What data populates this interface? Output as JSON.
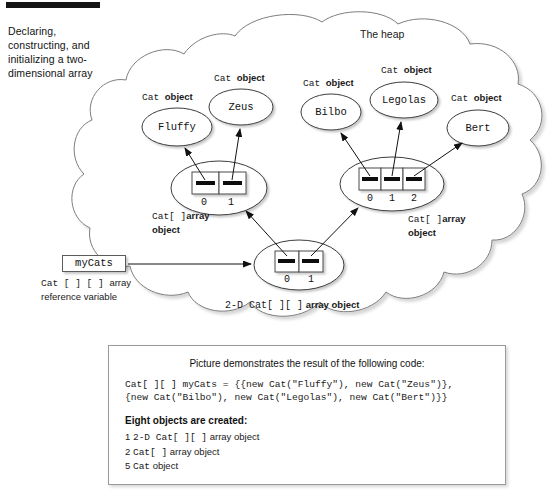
{
  "figure": {
    "side_caption": "Declaring, constructing, and initializing a two-dimensional array",
    "heap_label": "The heap"
  },
  "cat_objects": [
    {
      "name": "Fluffy",
      "caption_mono": "Cat ",
      "caption_bold": "object",
      "cx": 177,
      "cy": 127,
      "rx": 35,
      "ry": 19,
      "cap_x": 140,
      "cap_y": 95
    },
    {
      "name": "Zeus",
      "caption_mono": "Cat ",
      "caption_bold": "object",
      "cx": 241,
      "cy": 107,
      "rx": 32,
      "ry": 18,
      "cap_x": 213,
      "cap_y": 76
    },
    {
      "name": "Bilbo",
      "caption_mono": "Cat ",
      "caption_bold": "object",
      "cx": 331,
      "cy": 112,
      "rx": 30,
      "ry": 18,
      "cap_x": 302,
      "cap_y": 81
    },
    {
      "name": "Legolas",
      "caption_mono": "Cat ",
      "caption_bold": "object",
      "cx": 404,
      "cy": 100,
      "rx": 34,
      "ry": 18,
      "cap_x": 380,
      "cap_y": 69
    },
    {
      "name": "Bert",
      "caption_mono": "Cat ",
      "caption_bold": "object",
      "cx": 478,
      "cy": 128,
      "rx": 31,
      "ry": 18,
      "cap_x": 450,
      "cap_y": 96
    }
  ],
  "arrays": {
    "left": {
      "indices": [
        "0",
        "1"
      ],
      "label_line1_mono": "Cat[ ]",
      "label_line1_bold": "array",
      "label_line2_bold": "object",
      "label_x": 152,
      "label_y": 210
    },
    "right": {
      "indices": [
        "0",
        "1",
        "2"
      ],
      "label_line1_mono": "Cat[ ]",
      "label_line1_bold": "array",
      "label_line2_bold": "object",
      "label_x": 408,
      "label_y": 213
    },
    "twod": {
      "indices": [
        "0",
        "1"
      ],
      "label_mono": "2-D Cat[ ][ ]",
      "label_bold": "array object",
      "label_x": 225,
      "label_y": 299
    }
  },
  "variable": {
    "name": "myCats",
    "sub_mono": "Cat [ ] [ ] ",
    "sub_bold": "array",
    "sub_line2": "reference variable"
  },
  "panel": {
    "title": "Picture demonstrates the result of the following code:",
    "code_line1": "Cat[ ][ ] myCats = {{new Cat(\"Fluffy\"), new Cat(\"Zeus\")},",
    "code_line2": "{new Cat(\"Bilbo\"), new Cat(\"Legolas\"), new Cat(\"Bert\")}}",
    "summary": "Eight objects are created:",
    "items": [
      {
        "count": "1",
        "mono": "2-D Cat[ ][ ]",
        "text": " array object"
      },
      {
        "count": "2",
        "mono": "Cat[ ]",
        "text": " array object"
      },
      {
        "count": "5",
        "mono": "Cat",
        "text": "  object"
      }
    ]
  },
  "colors": {
    "ink": "#1a1a1a",
    "cloud_stroke": "#7d7d7d",
    "ellipse_stroke": "#3c3c3c",
    "cell_fill": "#ffffff",
    "ref_bar": "#111111",
    "panel_border": "#9a9a9a"
  }
}
